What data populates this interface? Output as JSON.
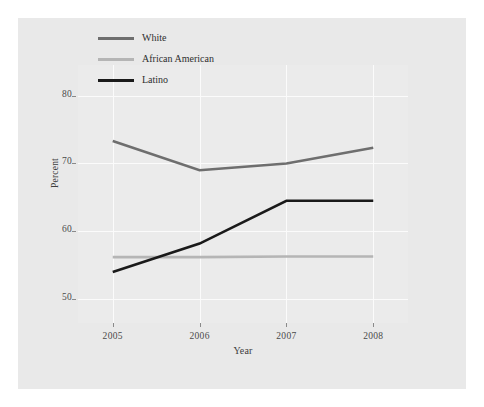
{
  "chart_data": {
    "type": "line",
    "title": "",
    "xlabel": "Year",
    "ylabel": "Percent",
    "categories": [
      "2005",
      "2006",
      "2007",
      "2008"
    ],
    "x": [
      2005,
      2006,
      2007,
      2008
    ],
    "xlim": [
      2004.6,
      2008.4
    ],
    "ylim": [
      46.5,
      84.5
    ],
    "yticks": [
      50,
      60,
      70,
      80
    ],
    "ytick_labels": [
      "50",
      "60",
      "70",
      "80"
    ],
    "xticks": [
      2005,
      2006,
      2007,
      2008
    ],
    "xtick_labels": [
      "2005",
      "2006",
      "2007",
      "2008"
    ],
    "grid": true,
    "grid_color": "#fbfbfb",
    "legend_position": "top-left-inside",
    "series": [
      {
        "name": "White",
        "color": "#6e6e6e",
        "values": [
          73.3,
          69.0,
          70.0,
          72.3
        ]
      },
      {
        "name": "African American",
        "color": "#b5b5b5",
        "values": [
          56.2,
          56.2,
          56.3,
          56.3
        ]
      },
      {
        "name": "Latino",
        "color": "#1a1a1a",
        "values": [
          54.0,
          58.2,
          64.5,
          64.5
        ]
      }
    ]
  },
  "figure": {
    "background": "#e9e9e9",
    "panel_background": "#ebebeb",
    "page_background": "#ffffff"
  }
}
